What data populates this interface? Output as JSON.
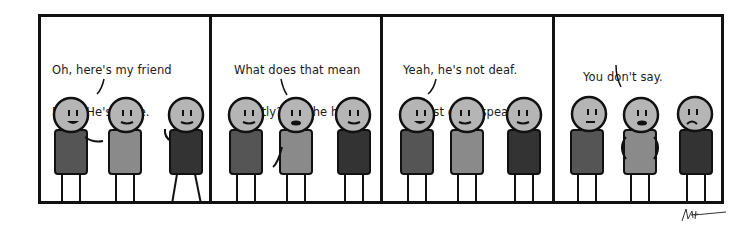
{
  "comic": {
    "panels": [
      {
        "caption_lines": [
          "Oh, here's my friend",
          "Mike. He's mute."
        ],
        "speaker": "left",
        "characters": [
          {
            "shirt": "#555555",
            "expression": "smile-open",
            "pose": "gesture-right"
          },
          {
            "shirt": "#8a8a8a",
            "expression": "smile",
            "pose": "arms-down"
          },
          {
            "shirt": "#333333",
            "expression": "smile",
            "pose": "wave"
          }
        ]
      },
      {
        "caption_lines": [
          "What does that mean",
          "exactly? Can he hear?"
        ],
        "speaker": "middle",
        "characters": [
          {
            "shirt": "#555555",
            "expression": "smile",
            "pose": "arms-down"
          },
          {
            "shirt": "#8a8a8a",
            "expression": "mouth-open",
            "pose": "gesture-left"
          },
          {
            "shirt": "#333333",
            "expression": "smile",
            "pose": "arms-down"
          }
        ]
      },
      {
        "caption_lines": [
          "Yeah, he's not deaf.",
          "He just can't speak."
        ],
        "speaker": "left",
        "characters": [
          {
            "shirt": "#555555",
            "expression": "smile-open",
            "pose": "arms-down"
          },
          {
            "shirt": "#8a8a8a",
            "expression": "smile",
            "pose": "arms-down"
          },
          {
            "shirt": "#333333",
            "expression": "smile",
            "pose": "arms-down"
          }
        ]
      },
      {
        "caption_lines": [
          "You don't say."
        ],
        "speaker": "middle",
        "characters": [
          {
            "shirt": "#555555",
            "expression": "flat",
            "pose": "arms-down"
          },
          {
            "shirt": "#8a8a8a",
            "expression": "mouth-open",
            "pose": "hands-hips"
          },
          {
            "shirt": "#333333",
            "expression": "frown",
            "pose": "arms-down"
          }
        ]
      }
    ],
    "signature": "signature-scribble",
    "colors": {
      "border": "#111111",
      "head": "#b5b5b5",
      "background": "#ffffff"
    }
  }
}
